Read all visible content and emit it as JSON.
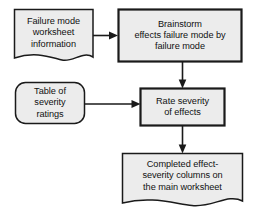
{
  "diagram": {
    "type": "flowchart",
    "colors": {
      "node_fill": "#ececec",
      "node_stroke": "#1a1a1a",
      "arrow": "#1a1a1a",
      "background": "#ffffff"
    },
    "nodes": [
      {
        "id": "failure-mode-worksheet",
        "shape": "document",
        "lines": [
          "Failure mode",
          "worksheet",
          "information"
        ]
      },
      {
        "id": "brainstorm-effects",
        "shape": "rectangle",
        "lines": [
          "Brainstorm",
          "effects failure mode by",
          "failure mode"
        ]
      },
      {
        "id": "table-severity",
        "shape": "rounded-rectangle",
        "lines": [
          "Table of",
          "severity",
          "ratings"
        ]
      },
      {
        "id": "rate-severity",
        "shape": "rectangle",
        "lines": [
          "Rate severity",
          "of effects"
        ]
      },
      {
        "id": "completed-columns",
        "shape": "document",
        "lines": [
          "Completed effect-",
          "severity columns on",
          "the main worksheet"
        ]
      }
    ],
    "edges": [
      {
        "id": "worksheet-to-brainstorm",
        "from": "failure-mode-worksheet",
        "to": "brainstorm-effects",
        "direction": "right"
      },
      {
        "id": "brainstorm-to-rate",
        "from": "brainstorm-effects",
        "to": "rate-severity",
        "direction": "down"
      },
      {
        "id": "table-to-rate",
        "from": "table-severity",
        "to": "rate-severity",
        "direction": "right"
      },
      {
        "id": "rate-to-completed",
        "from": "rate-severity",
        "to": "completed-columns",
        "direction": "down"
      }
    ]
  }
}
